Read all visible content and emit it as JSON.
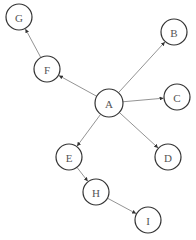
{
  "diagram": {
    "type": "directed-graph",
    "nodes": [
      {
        "id": "A",
        "label": "A",
        "x": 109,
        "y": 103,
        "r": 14
      },
      {
        "id": "B",
        "label": "B",
        "x": 174,
        "y": 32,
        "r": 13
      },
      {
        "id": "C",
        "label": "C",
        "x": 177,
        "y": 97,
        "r": 13
      },
      {
        "id": "D",
        "label": "D",
        "x": 168,
        "y": 157,
        "r": 13
      },
      {
        "id": "E",
        "label": "E",
        "x": 69,
        "y": 157,
        "r": 13
      },
      {
        "id": "F",
        "label": "F",
        "x": 47,
        "y": 69,
        "r": 13
      },
      {
        "id": "G",
        "label": "G",
        "x": 19,
        "y": 17,
        "r": 13
      },
      {
        "id": "H",
        "label": "H",
        "x": 96,
        "y": 192,
        "r": 13
      },
      {
        "id": "I",
        "label": "I",
        "x": 148,
        "y": 220,
        "r": 13
      }
    ],
    "edges": [
      {
        "from": "A",
        "to": "B"
      },
      {
        "from": "A",
        "to": "C"
      },
      {
        "from": "A",
        "to": "D"
      },
      {
        "from": "A",
        "to": "E"
      },
      {
        "from": "A",
        "to": "F"
      },
      {
        "from": "F",
        "to": "G"
      },
      {
        "from": "E",
        "to": "H"
      },
      {
        "from": "H",
        "to": "I"
      }
    ]
  }
}
